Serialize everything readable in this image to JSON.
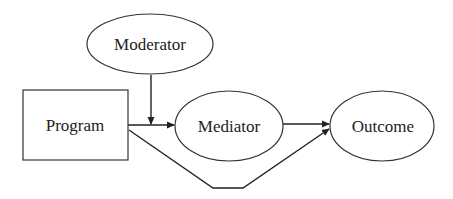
{
  "diagram": {
    "type": "moderated mediation model",
    "nodes": [
      {
        "id": "moderator",
        "label": "Moderator",
        "shape": "ellipse"
      },
      {
        "id": "program",
        "label": "Program",
        "shape": "rectangle"
      },
      {
        "id": "mediator",
        "label": "Mediator",
        "shape": "ellipse"
      },
      {
        "id": "outcome",
        "label": "Outcome",
        "shape": "ellipse"
      }
    ],
    "edges": [
      {
        "from": "program",
        "to": "mediator",
        "label": ""
      },
      {
        "from": "moderator",
        "to": "program-mediator-path",
        "label": ""
      },
      {
        "from": "mediator",
        "to": "outcome",
        "label": ""
      },
      {
        "from": "program",
        "to": "outcome",
        "label": "",
        "routing": "below"
      }
    ],
    "colors": {
      "stroke": "#333333",
      "text": "#222222",
      "background": "#ffffff"
    }
  }
}
